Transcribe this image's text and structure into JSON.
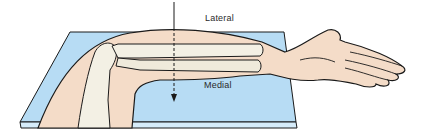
{
  "figure": {
    "labels": {
      "lateral": "Lateral",
      "medial": "Medial"
    },
    "colors": {
      "board": "#b7dcf4",
      "board_edge": "#8ec4e8",
      "skin": "#f4dcc8",
      "bone": "#f3f0e4",
      "outline": "#1a1a1a"
    }
  }
}
